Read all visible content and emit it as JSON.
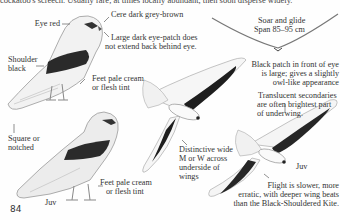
{
  "page": {
    "top_text": "cockatoo's screech. Usually rare, at times locally abundant, then soon disperse widely.",
    "page_number": "84"
  },
  "adult_perched": {
    "labels": {
      "eye": "Eye red",
      "cere": "Cere dark grey-brown",
      "eye_patch_1": "Large dark eye-patch does",
      "eye_patch_2": "not extend back behind eye.",
      "shoulder_1": "Shoulder",
      "shoulder_2": "black",
      "feet_1": "Feet pale cream",
      "feet_2": "or flesh tint",
      "tail_1": "Square or",
      "tail_2": "notched"
    }
  },
  "juv_perched": {
    "labels": {
      "age": "Juv",
      "feet_1": "Feet pale cream",
      "feet_2": "or flesh tint"
    }
  },
  "flight": {
    "soar_1": "Soar and glide",
    "soar_2": "Span 85–95 cm",
    "wings_1": "Distinctive wide",
    "wings_2": "M or W across",
    "wings_3": "underside of",
    "wings_4": "wings",
    "eye_patch_1": "Black patch in front of eye",
    "eye_patch_2": "is large; gives a slightly",
    "eye_patch_3": "owl-like appearance",
    "secondaries_1": "Translucent secondaries",
    "secondaries_2": "are often brightest part",
    "secondaries_3": "of underwing.",
    "juv_label": "Juv",
    "flight_note_1": "Flight is slower, more",
    "flight_note_2": "erratic, with deeper wing beats",
    "flight_note_3": "than the Black-Shouldered Kite."
  },
  "colors": {
    "paper": "#fefefe",
    "ink": "#2a2a2a",
    "wing_black": "#1e1e1e",
    "feather_grey": "#b9b9b9"
  }
}
